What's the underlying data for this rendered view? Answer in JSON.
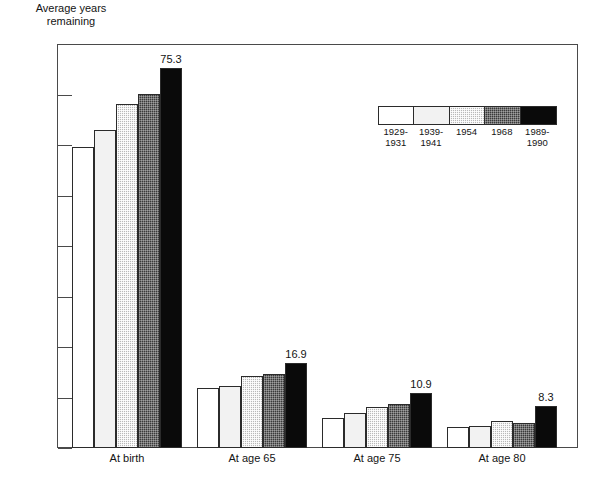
{
  "chart_data": {
    "type": "bar",
    "title": "",
    "ylabel": "Average years\nremaining",
    "xlabel": "",
    "ylim": [
      0,
      80
    ],
    "yticks": [
      0,
      10,
      20,
      30,
      40,
      50,
      60,
      70,
      80
    ],
    "grid": false,
    "legend_position": "upper-right",
    "categories": [
      "At birth",
      "At age 65",
      "At age 75",
      "At age 80"
    ],
    "series": [
      {
        "name": "1929-\n1931",
        "swatch": "white",
        "color": "#ffffff",
        "values": [
          59.7,
          11.9,
          6.0,
          4.1
        ]
      },
      {
        "name": "1939-\n1941",
        "swatch": "very-light-gray",
        "color": "#f2f2f2",
        "values": [
          62.9,
          12.2,
          7.0,
          4.3
        ]
      },
      {
        "name": "1954",
        "swatch": "light-gray-halftone",
        "color": "#b9b9b9",
        "values": [
          68.2,
          14.3,
          8.1,
          5.3
        ]
      },
      {
        "name": "1968",
        "swatch": "dark-gray-halftone",
        "color": "#3a3a3a",
        "values": [
          70.2,
          14.6,
          8.8,
          5.0
        ]
      },
      {
        "name": "1989-\n1990",
        "swatch": "black",
        "color": "#0a0a0a",
        "values": [
          75.3,
          16.9,
          10.9,
          8.3
        ]
      }
    ],
    "data_labels": [
      {
        "category": "At birth",
        "series": "1989-1990",
        "text": "75.3"
      },
      {
        "category": "At age 65",
        "series": "1989-1990",
        "text": "16.9"
      },
      {
        "category": "At age 75",
        "series": "1989-1990",
        "text": "10.9"
      },
      {
        "category": "At age 80",
        "series": "1989-1990",
        "text": "8.3"
      }
    ]
  },
  "axis": {
    "title": "Average years\nremaining",
    "ticks": [
      {
        "label": "80"
      },
      {
        "label": "70"
      },
      {
        "label": "60"
      },
      {
        "label": "50"
      },
      {
        "label": "40"
      },
      {
        "label": "30"
      },
      {
        "label": "20"
      },
      {
        "label": "10"
      },
      {
        "label": "0"
      }
    ]
  },
  "categories": [
    {
      "label": "At birth"
    },
    {
      "label": "At age 65"
    },
    {
      "label": "At age 75"
    },
    {
      "label": "At age 80"
    }
  ],
  "legend": {
    "entries": [
      {
        "label": "1929-\n1931"
      },
      {
        "label": "1939-\n1941"
      },
      {
        "label": "1954"
      },
      {
        "label": "1968"
      },
      {
        "label": "1989-\n1990"
      }
    ]
  },
  "labels": {
    "birth_top": "75.3",
    "age65_top": "16.9",
    "age75_top": "10.9",
    "age80_top": "8.3"
  },
  "bottom_caption": {
    "text": ""
  }
}
